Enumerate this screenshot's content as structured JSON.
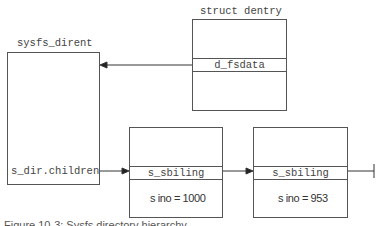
{
  "diagram": {
    "nodes": {
      "sysfs_dirent": {
        "title": "sysfs_dirent",
        "field": "s_dir.children"
      },
      "dentry": {
        "title": "struct dentry",
        "field": "d_fsdata"
      },
      "sibling1": {
        "field": "s_sbiling",
        "value": "s ino = 1000"
      },
      "sibling2": {
        "field": "s_sbiling",
        "value": "s ino = 953"
      }
    },
    "edges": [
      {
        "from": "dentry.d_fsdata",
        "to": "sysfs_dirent"
      },
      {
        "from": "sysfs_dirent.s_dir.children",
        "to": "sibling1.s_sbiling"
      },
      {
        "from": "sibling1.s_sbiling",
        "to": "sibling2.s_sbiling"
      },
      {
        "from": "sibling2.s_sbiling",
        "to": "terminator"
      }
    ],
    "caption": "Figure 10-3: Sysfs directory hierarchy"
  }
}
